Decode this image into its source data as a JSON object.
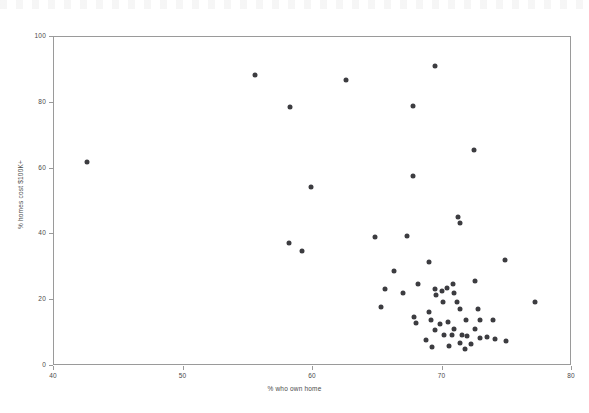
{
  "chart_data": {
    "type": "scatter",
    "title": "",
    "xlabel": "% who own home",
    "ylabel": "% homes cost $100K+",
    "xlim": [
      40,
      80
    ],
    "ylim": [
      0,
      100
    ],
    "xticks": [
      40,
      50,
      60,
      70,
      80
    ],
    "yticks": [
      0,
      20,
      40,
      60,
      80,
      100
    ],
    "grid": false,
    "legend": "none",
    "marker": {
      "shape": "circle",
      "color": "#3c3c40",
      "size_px": 5
    },
    "points": [
      {
        "x": 42.6,
        "y": 61.8
      },
      {
        "x": 55.6,
        "y": 88.0
      },
      {
        "x": 58.3,
        "y": 78.5
      },
      {
        "x": 62.6,
        "y": 86.5
      },
      {
        "x": 67.8,
        "y": 78.8
      },
      {
        "x": 69.5,
        "y": 91.0
      },
      {
        "x": 72.5,
        "y": 65.2
      },
      {
        "x": 59.9,
        "y": 54.2
      },
      {
        "x": 67.8,
        "y": 57.5
      },
      {
        "x": 58.2,
        "y": 37.0
      },
      {
        "x": 59.2,
        "y": 34.8
      },
      {
        "x": 64.9,
        "y": 39.0
      },
      {
        "x": 67.3,
        "y": 39.3
      },
      {
        "x": 71.3,
        "y": 45.0
      },
      {
        "x": 71.4,
        "y": 43.3
      },
      {
        "x": 74.9,
        "y": 32.0
      },
      {
        "x": 65.3,
        "y": 17.5
      },
      {
        "x": 65.6,
        "y": 23.0
      },
      {
        "x": 66.3,
        "y": 28.5
      },
      {
        "x": 67.0,
        "y": 21.8
      },
      {
        "x": 68.2,
        "y": 24.6
      },
      {
        "x": 69.0,
        "y": 31.3
      },
      {
        "x": 69.5,
        "y": 23.0
      },
      {
        "x": 69.6,
        "y": 21.3
      },
      {
        "x": 70.0,
        "y": 22.6
      },
      {
        "x": 70.1,
        "y": 19.2
      },
      {
        "x": 70.4,
        "y": 23.5
      },
      {
        "x": 70.9,
        "y": 24.6
      },
      {
        "x": 71.0,
        "y": 22.0
      },
      {
        "x": 71.2,
        "y": 19.3
      },
      {
        "x": 71.4,
        "y": 17.0
      },
      {
        "x": 71.9,
        "y": 13.7
      },
      {
        "x": 72.6,
        "y": 25.5
      },
      {
        "x": 72.8,
        "y": 17.0
      },
      {
        "x": 73.0,
        "y": 13.6
      },
      {
        "x": 74.0,
        "y": 13.6
      },
      {
        "x": 77.2,
        "y": 19.3
      },
      {
        "x": 67.9,
        "y": 14.5
      },
      {
        "x": 68.0,
        "y": 12.7
      },
      {
        "x": 69.0,
        "y": 16.0
      },
      {
        "x": 69.2,
        "y": 13.8
      },
      {
        "x": 69.5,
        "y": 10.5
      },
      {
        "x": 69.9,
        "y": 12.4
      },
      {
        "x": 70.2,
        "y": 9.0
      },
      {
        "x": 70.5,
        "y": 13.0
      },
      {
        "x": 70.8,
        "y": 9.2
      },
      {
        "x": 71.0,
        "y": 11.0
      },
      {
        "x": 71.4,
        "y": 6.8
      },
      {
        "x": 71.6,
        "y": 9.0
      },
      {
        "x": 72.0,
        "y": 8.8
      },
      {
        "x": 72.3,
        "y": 6.3
      },
      {
        "x": 72.6,
        "y": 11.0
      },
      {
        "x": 73.0,
        "y": 8.2
      },
      {
        "x": 73.5,
        "y": 8.5
      },
      {
        "x": 74.1,
        "y": 7.8
      },
      {
        "x": 75.0,
        "y": 7.2
      },
      {
        "x": 68.8,
        "y": 7.5
      },
      {
        "x": 69.3,
        "y": 5.5
      },
      {
        "x": 70.6,
        "y": 5.8
      },
      {
        "x": 71.8,
        "y": 4.8
      }
    ]
  }
}
